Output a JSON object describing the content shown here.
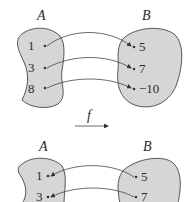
{
  "top_diagram": {
    "domain_label": "A",
    "codomain_label": "B",
    "domain_elements": [
      "1",
      "3",
      "8"
    ],
    "codomain_elements": [
      "5",
      "7",
      "−10"
    ],
    "mappings": [
      {
        "from": "1",
        "to": "5"
      },
      {
        "from": "3",
        "to": "7"
      },
      {
        "from": "8",
        "to": "−10"
      }
    ],
    "direction": "A to B"
  },
  "function_label": "f",
  "function_arrow": "right-arrow",
  "bottom_diagram": {
    "domain_label": "A",
    "codomain_label": "B",
    "domain_elements": [
      "1",
      "3"
    ],
    "codomain_elements": [
      "5",
      "7"
    ],
    "mappings": [
      {
        "from": "5",
        "to": "1"
      },
      {
        "from": "7",
        "to": "3"
      }
    ],
    "direction": "B to A"
  },
  "colors": {
    "set_fill": "#d6d6d6",
    "stroke": "#555555",
    "text": "#2a2a2a"
  }
}
